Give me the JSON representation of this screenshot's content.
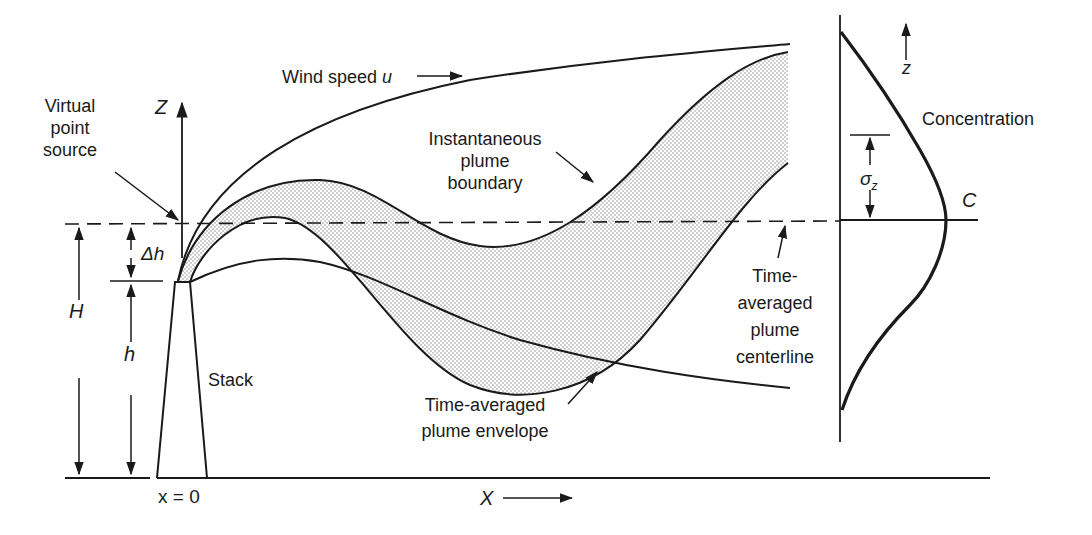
{
  "labels": {
    "wind_speed": "Wind speed",
    "wind_symbol": "u",
    "virtual_source": [
      "Virtual",
      "point",
      "source"
    ],
    "instantaneous": [
      "Instantaneous",
      "plume",
      "boundary"
    ],
    "centerline": [
      "Time-",
      "averaged",
      "plume",
      "centerline"
    ],
    "envelope": [
      "Time-averaged",
      "plume envelope"
    ],
    "stack": "Stack",
    "concentration": "Concentration",
    "origin": "x = 0",
    "x_axis": "X",
    "z_axis": "Z",
    "z_small": "z",
    "H": "H",
    "h": "h",
    "delta_h": "Δh",
    "sigma": "σ",
    "sigma_sub": "z",
    "C": "C"
  },
  "colors": {
    "line": "#1a1a1a",
    "shade": "#c8c8c8",
    "background": "#ffffff"
  }
}
